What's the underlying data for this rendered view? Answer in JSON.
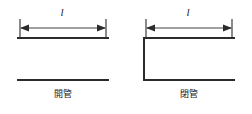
{
  "figure": {
    "background_color": "#ffffff",
    "line_color": "#2b2b2b",
    "panels": [
      {
        "id": "open-pipe",
        "caption": "開管",
        "dimension_label": "l",
        "dimension_arrow": {
          "style": "double-headed",
          "end_ticks": true,
          "x_start": 20,
          "x_end": 106,
          "y": 28
        },
        "walls": {
          "top_line": true,
          "bottom_line": true,
          "left_wall": false,
          "right_wall": false
        },
        "geometry": {
          "pipe_left": 18,
          "pipe_right": 108,
          "pipe_top": 38,
          "pipe_bottom": 80
        }
      },
      {
        "id": "closed-pipe",
        "caption": "閉管",
        "dimension_label": "l",
        "dimension_arrow": {
          "style": "double-headed",
          "end_ticks": true,
          "x_start": 20,
          "x_end": 106,
          "y": 28
        },
        "walls": {
          "top_line": true,
          "bottom_line": true,
          "left_wall": true,
          "right_wall": false
        },
        "geometry": {
          "pipe_left": 18,
          "pipe_right": 108,
          "pipe_top": 38,
          "pipe_bottom": 80
        }
      }
    ]
  }
}
